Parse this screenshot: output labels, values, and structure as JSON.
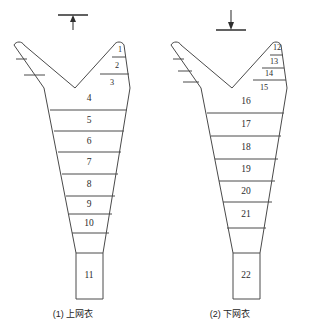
{
  "figure": {
    "background_color": "#ffffff",
    "line_color": "#4a4a4a",
    "text_color": "#2b2b2b",
    "panels": [
      {
        "id": "upper-net",
        "caption": "(1) 上网衣",
        "marker": {
          "name": "up-arrow-marker",
          "direction": "up",
          "description": "horizontal bar with upward arrow beneath"
        },
        "right_arm_segments": [
          "1",
          "2",
          "3"
        ],
        "body_segments": [
          "4",
          "5",
          "6",
          "7",
          "8",
          "9",
          "10"
        ],
        "codend_segment": "11",
        "segment_count": 11
      },
      {
        "id": "lower-net",
        "caption": "(2) 下网衣",
        "marker": {
          "name": "down-arrow-marker",
          "direction": "down",
          "description": "downward arrow landing on horizontal bar"
        },
        "right_arm_segments": [
          "12",
          "13",
          "14",
          "15"
        ],
        "body_segments": [
          "16",
          "17",
          "18",
          "19",
          "20",
          "21"
        ],
        "codend_segment": "22",
        "segment_count": 11
      }
    ]
  },
  "labels": {
    "left": {
      "a1": "1",
      "a2": "2",
      "a3": "3",
      "b4": "4",
      "b5": "5",
      "b6": "6",
      "b7": "7",
      "b8": "8",
      "b9": "9",
      "b10": "10",
      "c11": "11"
    },
    "right": {
      "a12": "12",
      "a13": "13",
      "a14": "14",
      "a15": "15",
      "b16": "16",
      "b17": "17",
      "b18": "18",
      "b19": "19",
      "b20": "20",
      "b21": "21",
      "c22": "22"
    }
  },
  "captions": {
    "left": "(1) 上网衣",
    "right": "(2) 下网衣"
  }
}
